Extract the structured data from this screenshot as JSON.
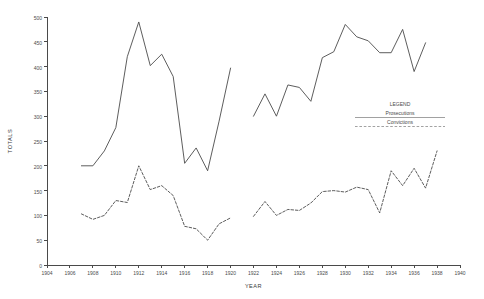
{
  "chart_data": {
    "type": "line",
    "title": "",
    "xlabel": "YEAR",
    "ylabel": "TOTALS",
    "xlim": [
      1904,
      1940
    ],
    "ylim": [
      0,
      500
    ],
    "xticks": [
      1904,
      1906,
      1908,
      1910,
      1912,
      1914,
      1916,
      1918,
      1920,
      1922,
      1924,
      1926,
      1928,
      1930,
      1932,
      1934,
      1936,
      1938,
      1940
    ],
    "yticks": [
      0,
      50,
      100,
      150,
      200,
      250,
      300,
      350,
      400,
      450,
      500
    ],
    "grid": false,
    "legend_position": "inside-right",
    "legend_title": "LEGEND",
    "series": [
      {
        "name": "Prosecutions",
        "style": "solid",
        "segments": [
          {
            "x": [
              1907,
              1908,
              1909,
              1910,
              1911,
              1912,
              1913,
              1914,
              1915,
              1916,
              1917,
              1918,
              1919,
              1920
            ],
            "y": [
              200,
              200,
              230,
              277,
              420,
              490,
              402,
              425,
              380,
              205,
              236,
              190,
              290,
              397
            ]
          },
          {
            "x": [
              1922,
              1923,
              1924,
              1925,
              1926,
              1927,
              1928,
              1929,
              1930,
              1931,
              1932,
              1933,
              1934,
              1935,
              1936,
              1937
            ],
            "y": [
              300,
              345,
              300,
              363,
              358,
              330,
              418,
              430,
              485,
              460,
              452,
              428,
              428,
              475,
              390,
              448
            ]
          }
        ]
      },
      {
        "name": "Convictions",
        "style": "dashed",
        "segments": [
          {
            "x": [
              1907,
              1908,
              1909,
              1910,
              1911,
              1912,
              1913,
              1914,
              1915,
              1916,
              1917,
              1918,
              1919,
              1920
            ],
            "y": [
              103,
              92,
              100,
              130,
              126,
              200,
              152,
              160,
              140,
              78,
              73,
              50,
              83,
              95
            ]
          },
          {
            "x": [
              1922,
              1923,
              1924,
              1925,
              1926,
              1927,
              1928,
              1929,
              1930,
              1931,
              1932,
              1933,
              1934,
              1935,
              1936,
              1937,
              1938
            ],
            "y": [
              98,
              128,
              100,
              112,
              110,
              125,
              148,
              150,
              147,
              157,
              152,
              105,
              190,
              160,
              195,
              155,
              230
            ]
          }
        ]
      }
    ]
  },
  "legend": {
    "title": "LEGEND",
    "entries": [
      {
        "label": "Prosecutions",
        "style": "solid"
      },
      {
        "label": "Convictions",
        "style": "dashed"
      }
    ]
  },
  "axes": {
    "y_title": "TOTALS",
    "x_title": "YEAR"
  }
}
